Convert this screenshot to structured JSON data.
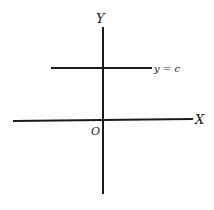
{
  "diagram": {
    "colors": {
      "ink": "#1a1a1a",
      "background": "#ffffff"
    },
    "axes": {
      "x": {
        "label": "X",
        "from": [
          13,
          121
        ],
        "to": [
          193,
          119
        ]
      },
      "y": {
        "label": "Y",
        "from": [
          103,
          27
        ],
        "to": [
          103,
          194
        ]
      },
      "origin_label": "O"
    },
    "lines": [
      {
        "label": "y = c",
        "from": [
          51,
          68
        ],
        "to": [
          152,
          68
        ]
      }
    ]
  }
}
